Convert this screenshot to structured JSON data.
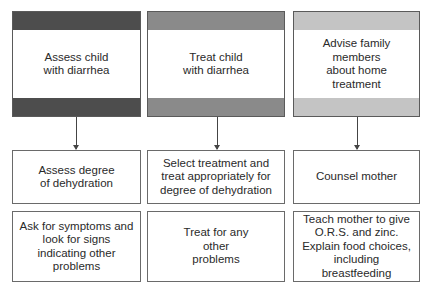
{
  "columns": [
    {
      "header": "Assess child with diarrhea",
      "bar_color": "#4d4d4d",
      "step1": "Assess degree of dehydration",
      "step2": "Ask for symptoms and look for signs indicating other problems"
    },
    {
      "header": "Treat child with diarrhea",
      "bar_color": "#8a8a8a",
      "step1": "Select treatment and treat appropriately for degree of dehydration",
      "step2": "Treat for any other problems"
    },
    {
      "header": "Advise family members about home treatment",
      "bar_color": "#c4c4c4",
      "step1": "Counsel mother",
      "step2": "Teach mother to give O.R.S. and zinc. Explain food choices, including breastfeeding"
    }
  ]
}
